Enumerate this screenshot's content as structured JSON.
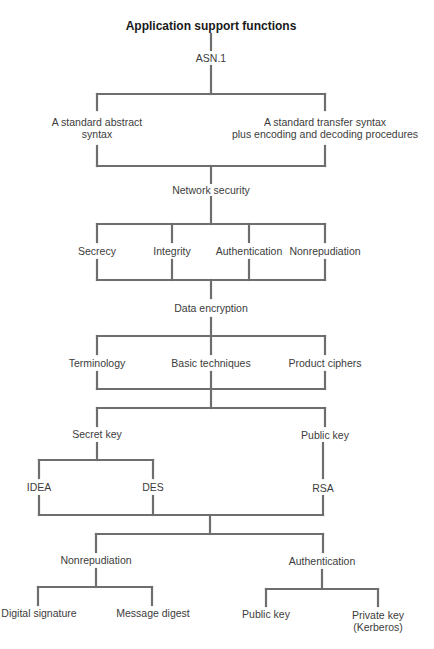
{
  "title": "Application support functions",
  "nodes": {
    "asn1": "ASN.1",
    "abstract_syntax_l1": "A standard abstract",
    "abstract_syntax_l2": "syntax",
    "transfer_syntax_l1": "A standard transfer syntax",
    "transfer_syntax_l2": "plus encoding and decoding procedures",
    "network_security": "Network security",
    "secrecy": "Secrecy",
    "integrity": "Integrity",
    "authentication": "Authentication",
    "nonrepudiation": "Nonrepudiation",
    "data_encryption": "Data encryption",
    "terminology": "Terminology",
    "basic_techniques": "Basic techniques",
    "product_ciphers": "Product ciphers",
    "secret_key": "Secret key",
    "public_key": "Public key",
    "idea": "IDEA",
    "des": "DES",
    "rsa": "RSA",
    "nonrepudiation2": "Nonrepudiation",
    "authentication2": "Authentication",
    "digital_signature": "Digital signature",
    "message_digest": "Message digest",
    "public_key2": "Public key",
    "private_key_l1": "Private key",
    "private_key_l2": "(Kerberos)"
  },
  "colors": {
    "line": "#6e6e6e",
    "text": "#3c3c3c",
    "background": "#ffffff"
  }
}
